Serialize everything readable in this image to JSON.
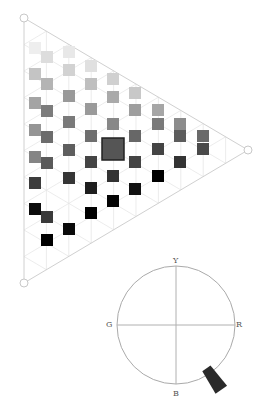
{
  "triangle": {
    "vertices": {
      "top_left": [
        24,
        18
      ],
      "bottom_left": [
        24,
        283
      ],
      "right": [
        248,
        150
      ]
    },
    "edge_color": "#d0d0d0",
    "grid_color": "#e4e4e4",
    "selected_swatch": {
      "x": 113,
      "y": 149,
      "size": 22,
      "color": "#555555",
      "border": "#222222"
    },
    "swatches": [
      {
        "x": 35,
        "y": 48,
        "c": "#eeeeee"
      },
      {
        "x": 35,
        "y": 74,
        "c": "#c4c4c4"
      },
      {
        "x": 35,
        "y": 103,
        "c": "#a4a4a4"
      },
      {
        "x": 35,
        "y": 130,
        "c": "#959595"
      },
      {
        "x": 35,
        "y": 157,
        "c": "#858585"
      },
      {
        "x": 35,
        "y": 183,
        "c": "#3c3c3c"
      },
      {
        "x": 35,
        "y": 209,
        "c": "#0c0c0c"
      },
      {
        "x": 47,
        "y": 57,
        "c": "#dddddd"
      },
      {
        "x": 47,
        "y": 84,
        "c": "#b4b4b4"
      },
      {
        "x": 47,
        "y": 111,
        "c": "#7c7c7c"
      },
      {
        "x": 47,
        "y": 137,
        "c": "#6c6c6c"
      },
      {
        "x": 47,
        "y": 163,
        "c": "#5a5a5a"
      },
      {
        "x": 47,
        "y": 217,
        "c": "#3a3a3a"
      },
      {
        "x": 47,
        "y": 240,
        "c": "#000000"
      },
      {
        "x": 69,
        "y": 52,
        "c": "#e8e8e8"
      },
      {
        "x": 69,
        "y": 70,
        "c": "#d2d2d2"
      },
      {
        "x": 69,
        "y": 96,
        "c": "#999999"
      },
      {
        "x": 69,
        "y": 122,
        "c": "#7a7a7a"
      },
      {
        "x": 69,
        "y": 150,
        "c": "#5e5e5e"
      },
      {
        "x": 69,
        "y": 178,
        "c": "#363636"
      },
      {
        "x": 69,
        "y": 229,
        "c": "#0a0a0a"
      },
      {
        "x": 91,
        "y": 66,
        "c": "#e0e0e0"
      },
      {
        "x": 91,
        "y": 84,
        "c": "#bfbfbf"
      },
      {
        "x": 91,
        "y": 109,
        "c": "#9a9a9a"
      },
      {
        "x": 91,
        "y": 136,
        "c": "#6e6e6e"
      },
      {
        "x": 91,
        "y": 162,
        "c": "#444444"
      },
      {
        "x": 91,
        "y": 188,
        "c": "#1e1e1e"
      },
      {
        "x": 91,
        "y": 213,
        "c": "#000000"
      },
      {
        "x": 113,
        "y": 79,
        "c": "#d0d0d0"
      },
      {
        "x": 113,
        "y": 97,
        "c": "#aaaaaa"
      },
      {
        "x": 113,
        "y": 124,
        "c": "#888888"
      },
      {
        "x": 113,
        "y": 176,
        "c": "#333333"
      },
      {
        "x": 113,
        "y": 201,
        "c": "#040404"
      },
      {
        "x": 135,
        "y": 93,
        "c": "#c8c8c8"
      },
      {
        "x": 135,
        "y": 110,
        "c": "#9e9e9e"
      },
      {
        "x": 135,
        "y": 136,
        "c": "#676767"
      },
      {
        "x": 135,
        "y": 162,
        "c": "#444444"
      },
      {
        "x": 135,
        "y": 189,
        "c": "#111111"
      },
      {
        "x": 158,
        "y": 110,
        "c": "#a6a6a6"
      },
      {
        "x": 158,
        "y": 124,
        "c": "#7a7a7a"
      },
      {
        "x": 158,
        "y": 149,
        "c": "#444444"
      },
      {
        "x": 158,
        "y": 176,
        "c": "#000000"
      },
      {
        "x": 180,
        "y": 124,
        "c": "#8c8c8c"
      },
      {
        "x": 180,
        "y": 136,
        "c": "#5c5c5c"
      },
      {
        "x": 180,
        "y": 162,
        "c": "#333333"
      },
      {
        "x": 203,
        "y": 136,
        "c": "#6a6a6a"
      },
      {
        "x": 203,
        "y": 149,
        "c": "#4a4a4a"
      }
    ]
  },
  "wheel": {
    "center": [
      176,
      325
    ],
    "radius": 59,
    "labels": {
      "top": "Y",
      "left": "G",
      "right": "R",
      "bottom": "B"
    },
    "handle_color": "#2a2a2a",
    "handle_angle_deg": 150
  }
}
